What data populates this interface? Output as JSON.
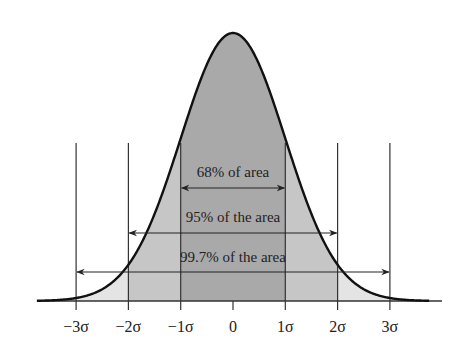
{
  "diagram": {
    "type": "normal-distribution",
    "axis_labels": [
      "−3σ",
      "−2σ",
      "−1σ",
      "0",
      "1σ",
      "2σ",
      "3σ"
    ],
    "annotations": [
      {
        "id": "one_sigma",
        "text": "68% of area",
        "range": [
          -1,
          1
        ]
      },
      {
        "id": "two_sigma",
        "text": "95% of the area",
        "range": [
          -2,
          2
        ]
      },
      {
        "id": "three_sigma",
        "text": "99.7% of the area",
        "range": [
          -3,
          3
        ]
      }
    ],
    "colors": {
      "band_1sigma": "#a9a9a9",
      "band_2sigma": "#c6c6c6",
      "band_3sigma": "#e4e4e4",
      "curve": "#111111",
      "lines": "#333333"
    }
  }
}
